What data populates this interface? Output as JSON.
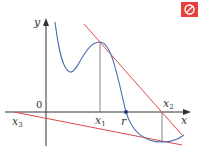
{
  "diagram": {
    "colors": {
      "curve": "#4a6fb3",
      "tangent": "#e04848",
      "axis": "#333333",
      "guide": "#666666",
      "icon_bg": "#e8413c"
    },
    "axes": {
      "x_label": "x",
      "y_label": "y",
      "origin_label": "0"
    },
    "labels": {
      "x1": {
        "base": "x",
        "sub": "1"
      },
      "x2": {
        "base": "x",
        "sub": "2"
      },
      "x3": {
        "base": "x",
        "sub": "3"
      },
      "root": "r"
    },
    "icon": "prohibited-icon"
  }
}
